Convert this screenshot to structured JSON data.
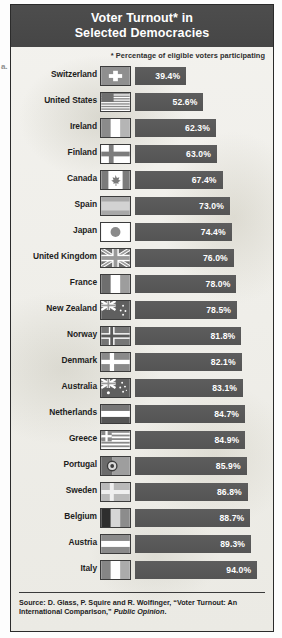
{
  "margin_note": "a.",
  "title": {
    "line1": "Voter Turnout* in",
    "line2": "Selected Democracies"
  },
  "subtitle": "* Percentage of eligible voters participating",
  "source": {
    "prefix": "Source: D. Glass, P. Squire and R. Wolfinger, “Voter Turnout: An International Comparison,” ",
    "italic": "Public Opinion",
    "suffix": "."
  },
  "chart_data": {
    "type": "bar",
    "title": "Voter Turnout* in Selected Democracies",
    "subtitle": "* Percentage of eligible voters participating",
    "orientation": "horizontal",
    "xlabel": "",
    "ylabel": "",
    "xlim": [
      0,
      100
    ],
    "grid": false,
    "legend": false,
    "value_suffix": "%",
    "categories": [
      "Switzerland",
      "United States",
      "Ireland",
      "Finland",
      "Canada",
      "Spain",
      "Japan",
      "United Kingdom",
      "France",
      "New Zealand",
      "Norway",
      "Denmark",
      "Australia",
      "Netherlands",
      "Greece",
      "Portugal",
      "Sweden",
      "Belgium",
      "Austria",
      "Italy"
    ],
    "values": [
      39.4,
      52.6,
      62.3,
      63.0,
      67.4,
      73.0,
      74.4,
      76.0,
      78.0,
      78.5,
      81.8,
      82.1,
      83.1,
      84.7,
      84.9,
      85.9,
      86.8,
      88.7,
      89.3,
      94.0
    ],
    "rows": [
      {
        "country": "Switzerland",
        "value": 39.4,
        "label": "39.4%",
        "flag": "flag-switzerland"
      },
      {
        "country": "United States",
        "value": 52.6,
        "label": "52.6%",
        "flag": "flag-united-states"
      },
      {
        "country": "Ireland",
        "value": 62.3,
        "label": "62.3%",
        "flag": "flag-ireland"
      },
      {
        "country": "Finland",
        "value": 63.0,
        "label": "63.0%",
        "flag": "flag-finland"
      },
      {
        "country": "Canada",
        "value": 67.4,
        "label": "67.4%",
        "flag": "flag-canada"
      },
      {
        "country": "Spain",
        "value": 73.0,
        "label": "73.0%",
        "flag": "flag-spain"
      },
      {
        "country": "Japan",
        "value": 74.4,
        "label": "74.4%",
        "flag": "flag-japan"
      },
      {
        "country": "United Kingdom",
        "value": 76.0,
        "label": "76.0%",
        "flag": "flag-united-kingdom"
      },
      {
        "country": "France",
        "value": 78.0,
        "label": "78.0%",
        "flag": "flag-france"
      },
      {
        "country": "New Zealand",
        "value": 78.5,
        "label": "78.5%",
        "flag": "flag-new-zealand"
      },
      {
        "country": "Norway",
        "value": 81.8,
        "label": "81.8%",
        "flag": "flag-norway"
      },
      {
        "country": "Denmark",
        "value": 82.1,
        "label": "82.1%",
        "flag": "flag-denmark"
      },
      {
        "country": "Australia",
        "value": 83.1,
        "label": "83.1%",
        "flag": "flag-australia"
      },
      {
        "country": "Netherlands",
        "value": 84.7,
        "label": "84.7%",
        "flag": "flag-netherlands"
      },
      {
        "country": "Greece",
        "value": 84.9,
        "label": "84.9%",
        "flag": "flag-greece"
      },
      {
        "country": "Portugal",
        "value": 85.9,
        "label": "85.9%",
        "flag": "flag-portugal"
      },
      {
        "country": "Sweden",
        "value": 86.8,
        "label": "86.8%",
        "flag": "flag-sweden"
      },
      {
        "country": "Belgium",
        "value": 88.7,
        "label": "88.7%",
        "flag": "flag-belgium"
      },
      {
        "country": "Austria",
        "value": 89.3,
        "label": "89.3%",
        "flag": "flag-austria"
      },
      {
        "country": "Italy",
        "value": 94.0,
        "label": "94.0%",
        "flag": "flag-italy"
      }
    ]
  },
  "colors": {
    "header_band": "#4a4a4a",
    "bar": "#585858",
    "bar_text": "#ffffff",
    "frame": "#2b2b2b",
    "background": "#efeee9"
  }
}
